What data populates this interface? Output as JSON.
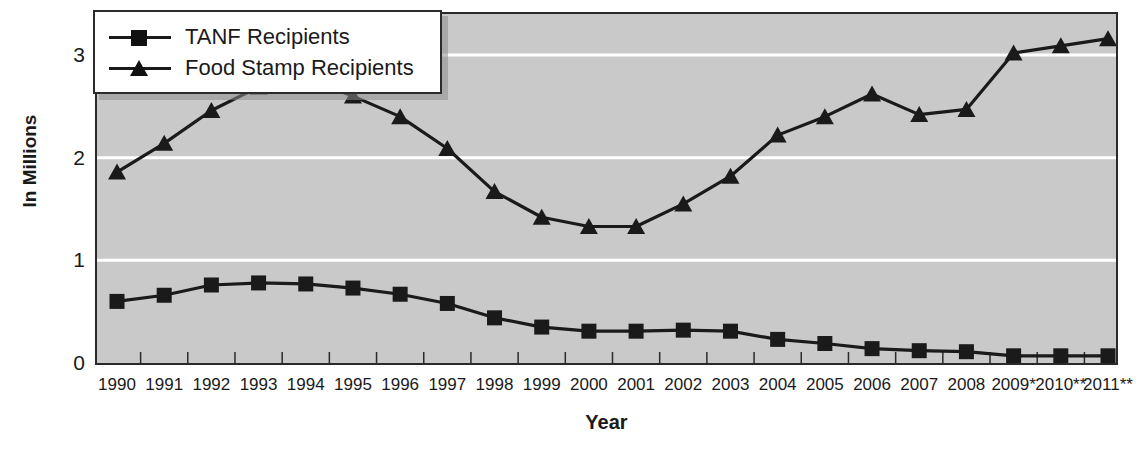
{
  "chart_data": {
    "type": "line",
    "title": "",
    "xlabel": "Year",
    "ylabel": "In Millions",
    "grid": true,
    "grid_color": "#ffffff",
    "plot_background": "#c9c9c9",
    "line_color": "#1a1a1a",
    "legend_position": "top-left",
    "ylim": [
      0,
      3.4
    ],
    "yticks": [
      0,
      1,
      2,
      3
    ],
    "ytick_labels": [
      "0",
      "1",
      "2",
      "3"
    ],
    "categories": [
      "1990",
      "1991",
      "1992",
      "1993",
      "1994",
      "1995",
      "1996",
      "1997",
      "1998",
      "1999",
      "2000",
      "2001",
      "2002",
      "2003",
      "2004",
      "2005",
      "2006",
      "2007",
      "2008",
      "2009*",
      "2010**",
      "2011**"
    ],
    "series": [
      {
        "name": "TANF Recipients",
        "marker": "square",
        "values": [
          0.6,
          0.66,
          0.76,
          0.78,
          0.77,
          0.73,
          0.67,
          0.58,
          0.44,
          0.35,
          0.31,
          0.31,
          0.32,
          0.31,
          0.23,
          0.19,
          0.14,
          0.12,
          0.11,
          0.07,
          0.07,
          0.07
        ]
      },
      {
        "name": "Food Stamp Recipients",
        "marker": "triangle",
        "values": [
          1.86,
          2.14,
          2.46,
          2.69,
          2.77,
          2.6,
          2.4,
          2.09,
          1.67,
          1.42,
          1.33,
          1.33,
          1.55,
          1.82,
          2.22,
          2.4,
          2.62,
          2.42,
          2.47,
          3.02,
          3.09,
          3.16
        ]
      }
    ]
  }
}
